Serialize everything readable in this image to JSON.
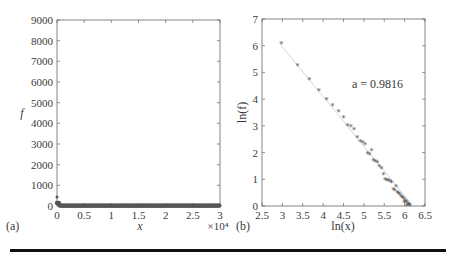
{
  "chart_data": [
    {
      "panel": "(a)",
      "type": "scatter",
      "xlabel": "x",
      "ylabel": "f",
      "x_multiplier": "×10⁴",
      "xlim": [
        0,
        3
      ],
      "ylim": [
        0,
        9000
      ],
      "xticks": [
        "0",
        "0.5",
        "1",
        "1.5",
        "2",
        "2.5",
        "3"
      ],
      "yticks": [
        "0",
        "1000",
        "2000",
        "3000",
        "4000",
        "5000",
        "6000",
        "7000",
        "8000",
        "9000"
      ],
      "grid": false,
      "series": [
        {
          "name": "f vs x",
          "x": [
            0.0,
            0.002,
            0.005,
            0.01,
            0.02,
            0.05,
            0.1,
            0.5,
            1,
            1.5,
            2,
            2.5,
            3
          ],
          "y": [
            430,
            200,
            120,
            80,
            40,
            20,
            10,
            5,
            3,
            2,
            1,
            1,
            1
          ]
        }
      ]
    },
    {
      "panel": "(b)",
      "type": "scatter",
      "xlabel": "ln(x)",
      "ylabel": "ln(f)",
      "xlim": [
        2.5,
        6.5
      ],
      "ylim": [
        0,
        7
      ],
      "xticks": [
        "2.5",
        "3",
        "3.5",
        "4",
        "4.5",
        "5",
        "5.5",
        "6",
        "6.5"
      ],
      "yticks": [
        "0",
        "1",
        "2",
        "3",
        "4",
        "5",
        "6",
        "7"
      ],
      "grid": false,
      "annotation": "a = 0.9816",
      "fit_line": {
        "x": [
          2.95,
          6.15
        ],
        "y": [
          6.05,
          0.1
        ]
      },
      "series": [
        {
          "name": "ln f vs ln x",
          "x": [
            2.97,
            3.37,
            3.66,
            3.89,
            4.08,
            4.23,
            4.38,
            4.5,
            4.6,
            4.68,
            4.76,
            4.84,
            4.91,
            4.97,
            5.03,
            5.09,
            5.14,
            5.19,
            5.23,
            5.28,
            5.33,
            5.38,
            5.43,
            5.48,
            5.52,
            5.56,
            5.6,
            5.64,
            5.68,
            5.72,
            5.76,
            5.79,
            5.82,
            5.85,
            5.88,
            5.91,
            5.94,
            5.97,
            6.0,
            6.03,
            6.06,
            6.09,
            6.11,
            6.13,
            5.99,
            6.05
          ],
          "y": [
            6.05,
            5.23,
            4.73,
            4.3,
            3.98,
            3.73,
            3.53,
            3.28,
            3.0,
            2.95,
            2.83,
            2.55,
            2.4,
            2.35,
            2.3,
            1.95,
            1.9,
            2.05,
            1.7,
            1.65,
            1.6,
            1.45,
            1.4,
            1.15,
            0.98,
            0.95,
            0.92,
            0.9,
            0.85,
            0.6,
            0.55,
            0.7,
            0.5,
            0.45,
            0.4,
            0.35,
            0.3,
            0.25,
            0.2,
            0.15,
            0.1,
            0.05,
            0.02,
            0.01,
            0.1,
            0.0
          ]
        }
      ]
    }
  ]
}
